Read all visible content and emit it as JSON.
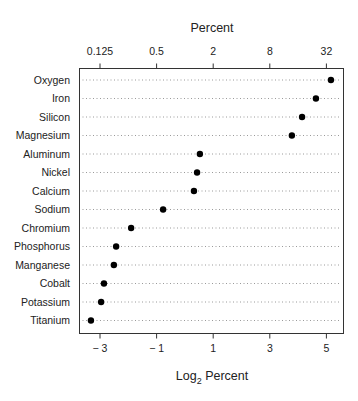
{
  "chart_data": {
    "type": "scatter",
    "subtype": "dot-plot",
    "title": "",
    "top_axis": {
      "title": "Percent",
      "ticks": [
        {
          "label": "0.125",
          "log2": -3
        },
        {
          "label": "0.5",
          "log2": -1
        },
        {
          "label": "2",
          "log2": 1
        },
        {
          "label": "8",
          "log2": 3
        },
        {
          "label": "32",
          "log2": 5
        }
      ]
    },
    "bottom_axis": {
      "title_main": "Log",
      "title_sub": "2",
      "title_rest": " Percent",
      "ticks": [
        {
          "label": "− 3",
          "value": -3
        },
        {
          "label": "− 1",
          "value": -1
        },
        {
          "label": "1",
          "value": 1
        },
        {
          "label": "3",
          "value": 3
        },
        {
          "label": "5",
          "value": 5
        }
      ]
    },
    "xlim": [
      -3.75,
      5.6
    ],
    "grid": "dotted horizontal lines per category",
    "legend": "none",
    "categories": [
      "Oxygen",
      "Iron",
      "Silicon",
      "Magnesium",
      "Aluminum",
      "Nickel",
      "Calcium",
      "Sodium",
      "Chromium",
      "Phosphorus",
      "Manganese",
      "Cobalt",
      "Potassium",
      "Titanium"
    ],
    "values_log2_percent": [
      5.16,
      4.63,
      4.14,
      3.78,
      0.53,
      0.43,
      0.32,
      -0.77,
      -1.9,
      -2.43,
      -2.51,
      -2.86,
      -2.96,
      -3.32
    ],
    "xlabel": "Log2 Percent",
    "ylabel": ""
  }
}
